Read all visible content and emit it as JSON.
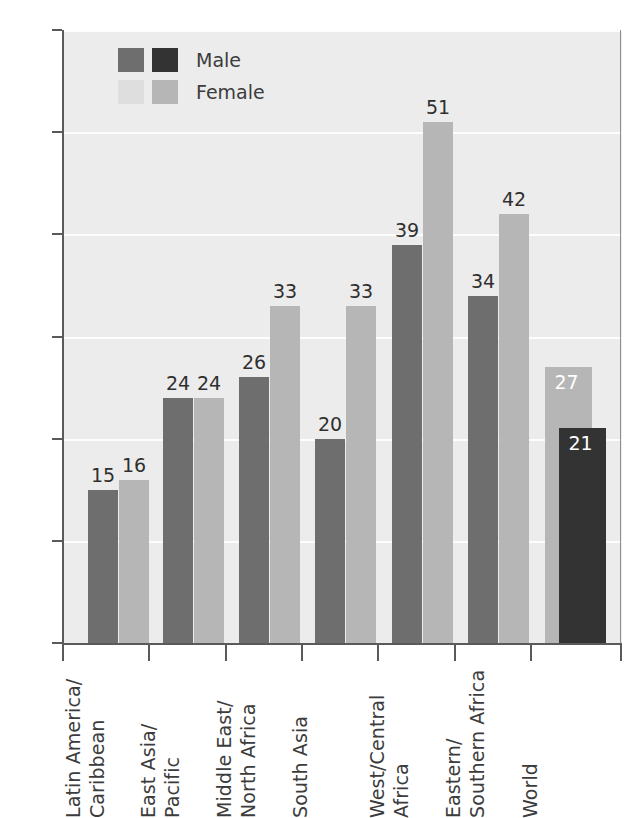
{
  "chart_data": {
    "type": "bar",
    "title": "",
    "subtitle": "",
    "xlabel": "",
    "ylabel": "",
    "ylim": [
      0,
      60
    ],
    "grid": true,
    "legend_position": "top-left",
    "categories": [
      "Latin America/\nCaribbean",
      "East Asia/\nPacific",
      "Middle East/\nNorth Africa",
      "South Asia",
      "West/Central\nAfrica",
      "Eastern/\nSouthern Africa",
      "World"
    ],
    "series": [
      {
        "name": "Male",
        "values": [
          15,
          24,
          26,
          20,
          39,
          34,
          21
        ]
      },
      {
        "name": "Female",
        "values": [
          16,
          24,
          33,
          33,
          51,
          42,
          27
        ]
      }
    ],
    "ytick_labels": [
      "0%",
      "10%",
      "20%",
      "30%",
      "40%",
      "50%",
      "60%"
    ],
    "ytick_values": [
      0,
      10,
      20,
      30,
      40,
      50,
      60
    ],
    "value_unit": "%"
  },
  "legend": {
    "items": [
      {
        "label": "Male",
        "color_a": "#6e6e6e",
        "color_b": "#333333"
      },
      {
        "label": "Female",
        "color_a": "#dedede",
        "color_b": "#b6b6b6"
      }
    ]
  },
  "axis": {
    "y_ticks": [
      {
        "label": "60%",
        "value": 60
      },
      {
        "label": "50%",
        "value": 50
      },
      {
        "label": "40%",
        "value": 40
      },
      {
        "label": "30%",
        "value": 30
      },
      {
        "label": "20%",
        "value": 20
      },
      {
        "label": "10%",
        "value": 10
      },
      {
        "label": "0%",
        "value": 0
      }
    ]
  },
  "groups": [
    {
      "name": "Latin America/Caribbean",
      "label_lines": [
        "Latin America/",
        "Caribbean"
      ],
      "overlay": false,
      "male": {
        "value": 15,
        "label": "15"
      },
      "female": {
        "value": 16,
        "label": "16"
      }
    },
    {
      "name": "East Asia/Pacific",
      "label_lines": [
        "East Asia/",
        "Pacific"
      ],
      "overlay": false,
      "male": {
        "value": 24,
        "label": "24"
      },
      "female": {
        "value": 24,
        "label": "24"
      }
    },
    {
      "name": "Middle East/North Africa",
      "label_lines": [
        "Middle East/",
        "North Africa"
      ],
      "overlay": false,
      "male": {
        "value": 26,
        "label": "26"
      },
      "female": {
        "value": 33,
        "label": "33"
      }
    },
    {
      "name": "South Asia",
      "label_lines": [
        "South Asia"
      ],
      "overlay": false,
      "male": {
        "value": 20,
        "label": "20"
      },
      "female": {
        "value": 33,
        "label": "33"
      }
    },
    {
      "name": "West/Central Africa",
      "label_lines": [
        "West/Central",
        "Africa"
      ],
      "overlay": false,
      "male": {
        "value": 39,
        "label": "39"
      },
      "female": {
        "value": 51,
        "label": "51"
      }
    },
    {
      "name": "Eastern/Southern Africa",
      "label_lines": [
        "Eastern/",
        "Southern Africa"
      ],
      "overlay": false,
      "male": {
        "value": 34,
        "label": "34"
      },
      "female": {
        "value": 42,
        "label": "42"
      }
    },
    {
      "name": "World",
      "label_lines": [
        "World"
      ],
      "overlay": true,
      "male": {
        "value": 21,
        "label": "21"
      },
      "female": {
        "value": 27,
        "label": "27"
      }
    }
  ],
  "colors": {
    "male": "#6e6e6e",
    "male_dark": "#333333",
    "female": "#b6b6b6",
    "female_light": "#dedede",
    "plot_background": "#ececec",
    "gridline": "#fdfdfd",
    "axis": "#5a5a5a",
    "text": "#3c3c3c"
  }
}
